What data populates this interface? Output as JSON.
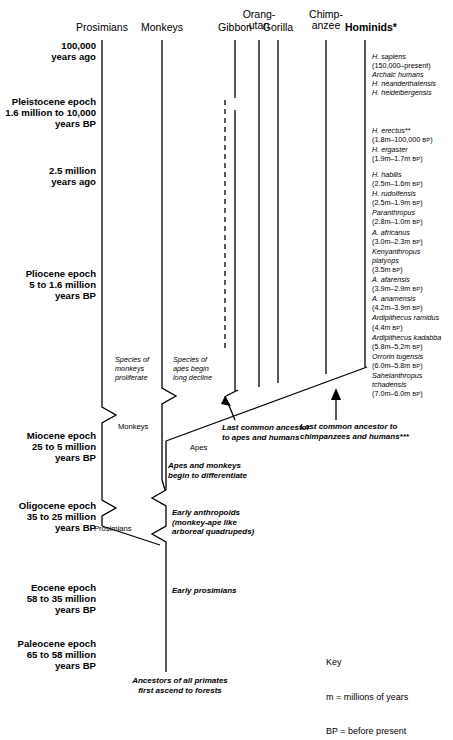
{
  "diagram": {
    "columns": [
      {
        "id": "prosimians",
        "label": "Prosimians",
        "bold": false
      },
      {
        "id": "monkeys",
        "label": "Monkeys",
        "bold": false
      },
      {
        "id": "gibbon",
        "label": "Gibbon",
        "bold": false
      },
      {
        "id": "orangutan",
        "label": "Orang-\nutan",
        "bold": false
      },
      {
        "id": "gorilla",
        "label": "Gorilla",
        "bold": false
      },
      {
        "id": "chimpanzee",
        "label": "Chimp-\nanzee",
        "bold": false
      },
      {
        "id": "hominids",
        "label": "Hominids*",
        "bold": true
      }
    ],
    "epochs": [
      {
        "id": "100k",
        "label": "100,000\nyears ago"
      },
      {
        "id": "pleistocene",
        "label": "Pleistocene epoch\n1.6 million to 10,000\nyears BP"
      },
      {
        "id": "25m",
        "label": "2.5 million\nyears ago"
      },
      {
        "id": "pliocene",
        "label": "Pliocene epoch\n5 to 1.6 million\nyears BP"
      },
      {
        "id": "miocene",
        "label": "Miocene epoch\n25 to 5 million\nyears BP"
      },
      {
        "id": "oligocene",
        "label": "Oligocene epoch\n35 to 25 million\nyears BP"
      },
      {
        "id": "eocene",
        "label": "Eocene epoch\n58 to 35 million\nyears BP"
      },
      {
        "id": "paleocene",
        "label": "Paleocene epoch\n65 to 58 million\nyears BP"
      }
    ],
    "hominid_groups": [
      {
        "id": "group-sapiens",
        "entries": [
          {
            "name": "H. sapiens",
            "range": "(150,000–present)"
          },
          {
            "name": "Archaic humans",
            "range": ""
          },
          {
            "name": "H. neanderthalensis",
            "range": ""
          },
          {
            "name": "H. heidelbergensis",
            "range": ""
          }
        ]
      },
      {
        "id": "group-erectus",
        "entries": [
          {
            "name": "H. erectus**",
            "range": "(1.8m–100,000 BP)"
          },
          {
            "name": "H. ergaster",
            "range": "(1.9m–1.7m BP)"
          }
        ]
      },
      {
        "id": "group-habilis",
        "entries": [
          {
            "name": "H. habilis",
            "range": "(2.5m–1.6m BP)"
          },
          {
            "name": "H. rudolfensis",
            "range": "(2.5m–1.9m BP)"
          },
          {
            "name": "Paranthropus",
            "range": "(2.8m–1.0m BP)"
          },
          {
            "name": "A. africanus",
            "range": "(3.0m–2.3m BP)"
          },
          {
            "name": "Kenyanthropus",
            "range": ""
          },
          {
            "name": "platyops",
            "range": "(3.5m BP)"
          },
          {
            "name": "A. afarensis",
            "range": "(3.9m–2.9m BP)"
          },
          {
            "name": "A. anamensis",
            "range": "(4.2m–3.9m BP)"
          },
          {
            "name": "Ardipithecus ramidus",
            "range": ""
          },
          {
            "name": "",
            "range": "(4.4m BP)"
          },
          {
            "name": "Ardipithecus kadabba",
            "range": ""
          },
          {
            "name": "",
            "range": "(5.8m–5.2m BP)"
          },
          {
            "name": "Orrorin tugensis",
            "range": ""
          },
          {
            "name": "",
            "range": "(6.0m–5.8m BP)"
          },
          {
            "name": "Sahelanthropus",
            "range": ""
          },
          {
            "name": "tchadensis",
            "range": ""
          },
          {
            "name": "",
            "range": "(7.0m–6.0m BP)"
          }
        ]
      }
    ],
    "annotations": {
      "monkeys_proliferate": "Species of\nmonkeys\nproliferate",
      "apes_decline": "Species of\napes begin\nlong decline",
      "monkeys_branch": "Monkeys",
      "apes_branch": "Apes",
      "prosimians_branch": "Prosimians",
      "lca_apes_humans": "Last common ancestor\nto apes and humans",
      "lca_chimps_humans": "Last common ancestor to\nchimpanzees and humans***",
      "apes_monkeys_differentiate": "Apes and monkeys\nbegin to differentiate",
      "early_anthropoids": "Early anthropoids\n(monkey-ape like\narboreal quadrupeds)",
      "early_prosimians": "Early prosimians",
      "ancestors_primates": "Ancestors of all primates\nfirst ascend to forests"
    },
    "key": {
      "title": "Key",
      "lines": [
        "m = millions of years",
        "BP = before present"
      ]
    },
    "colors": {
      "line": "#000000",
      "background": "#ffffff",
      "text": "#000000"
    }
  }
}
